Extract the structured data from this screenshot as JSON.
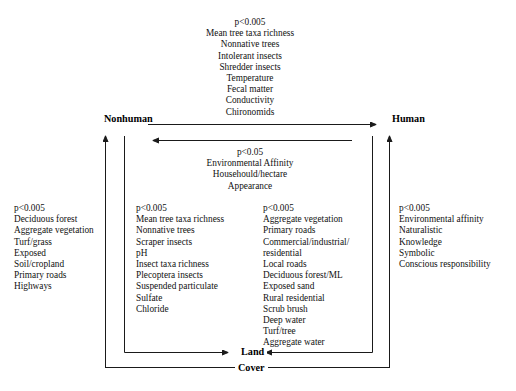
{
  "diagram": {
    "title_present": false,
    "nodes": {
      "nonhuman": "Nonhuman",
      "human": "Human",
      "land": "Land",
      "cover": "Cover"
    },
    "blocks": {
      "top_center": {
        "significance": "p<0.005",
        "items": [
          "Mean tree taxa richness",
          "Nonnative trees",
          "Intolerant insects",
          "Shredder insects",
          "Temperature",
          "Fecal matter",
          "Conductivity",
          "Chironomids"
        ],
        "text": "p<0.005\nMean tree taxa richness\nNonnative trees\nIntolerant insects\nShredder insects\nTemperature\nFecal matter\nConductivity\nChironomids"
      },
      "middle_center": {
        "significance": "p<0.05",
        "items": [
          "Environmental Affinity",
          "Househould/hectare",
          "Appearance"
        ],
        "text": "p<0.05\nEnvironmental Affinity\nHousehould/hectare\nAppearance"
      },
      "far_left": {
        "significance": "p<0.005",
        "items": [
          "Deciduous forest",
          "Aggregate vegetation",
          "Turf/grass",
          "Exposed",
          "Soil/cropland",
          "Primary roads",
          "Highways"
        ],
        "text": "p<0.005\nDeciduous forest\nAggregate vegetation\nTurf/grass\nExposed\nSoil/cropland\nPrimary roads\nHighways"
      },
      "inner_left": {
        "significance": "p<0.005",
        "items": [
          "Mean tree taxa richness",
          "Nonnative trees",
          "Scraper insects",
          "pH",
          "Insect taxa richness",
          "Plecoptera insects",
          "Suspended particulate",
          "Sulfate",
          "Chloride"
        ],
        "text": "p<0.005\nMean tree taxa richness\nNonnative trees\nScraper insects\npH\nInsect taxa richness\nPlecoptera insects\nSuspended particulate\nSulfate\nChloride"
      },
      "inner_right": {
        "significance": "p<0.005",
        "items": [
          "Aggregate vegetation",
          "Primary roads",
          "Commercial/industrial/",
          "residential",
          "Local roads",
          "Deciduous forest/ML",
          "Exposed sand",
          "Rural residential",
          "Scrub brush",
          "Deep water",
          "Turf/tree",
          "Aggregate water"
        ],
        "text": "p<0.005\nAggregate vegetation\nPrimary roads\nCommercial/industrial/\nresidential\nLocal roads\nDeciduous forest/ML\nExposed sand\nRural residential\nScrub brush\nDeep water\nTurf/tree\nAggregate water"
      },
      "far_right": {
        "significance": "p<0.005",
        "items": [
          "Environmental affinity",
          "Naturalistic",
          "Knowledge",
          "Symbolic",
          "Conscious responsibility"
        ],
        "text": "p<0.005\nEnvironmental affinity\nNaturalistic\nKnowledge\nSymbolic\nConscious responsibility"
      }
    },
    "colors": {
      "line": "#1a1a1a",
      "text": "#111111",
      "background": "#ffffff"
    }
  }
}
